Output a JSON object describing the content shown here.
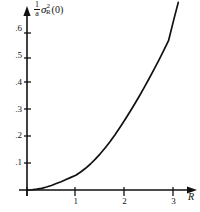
{
  "figure": {
    "background_color": "#ffffff",
    "ink_color": "#111111"
  },
  "axis_labels": {
    "y_caption_numerator": "1",
    "y_caption_denominator": "a",
    "y_caption_symbol": "σ",
    "y_caption_superscript": "2",
    "y_caption_subscript": "R",
    "y_caption_argument": "(0)",
    "x_name": "R"
  },
  "chart_data": {
    "type": "line",
    "title": "",
    "xlabel": "R",
    "ylabel": "(1/a) σ²_R(0)",
    "xlim": [
      0,
      3.35
    ],
    "ylim": [
      0,
      0.72
    ],
    "grid": false,
    "legend": null,
    "xticks": [
      1,
      2,
      3
    ],
    "xtick_labels": [
      "1",
      "2",
      "3"
    ],
    "yticks": [
      0.1,
      0.2,
      0.3,
      0.4,
      0.5,
      0.6
    ],
    "ytick_labels": [
      ".1",
      ".2",
      ".3",
      ".4",
      ".5",
      ".6"
    ],
    "series": [
      {
        "name": "sigma_R_squared_normalized",
        "x": [
          0.0,
          0.1,
          0.2,
          0.3,
          0.4,
          0.5,
          0.6,
          0.7,
          0.8,
          0.9,
          1.0,
          1.1,
          1.2,
          1.3,
          1.4,
          1.5,
          1.6,
          1.7,
          1.8,
          1.9,
          2.0,
          2.1,
          2.2,
          2.3,
          2.4,
          2.5,
          2.6,
          2.7,
          2.8,
          2.9,
          3.0,
          3.1
        ],
        "y": [
          0.0,
          0.001,
          0.003,
          0.006,
          0.011,
          0.017,
          0.024,
          0.031,
          0.039,
          0.047,
          0.055,
          0.067,
          0.081,
          0.097,
          0.115,
          0.135,
          0.157,
          0.18,
          0.205,
          0.232,
          0.26,
          0.289,
          0.319,
          0.35,
          0.382,
          0.415,
          0.449,
          0.484,
          0.52,
          0.557,
          0.63,
          0.7
        ]
      }
    ]
  }
}
